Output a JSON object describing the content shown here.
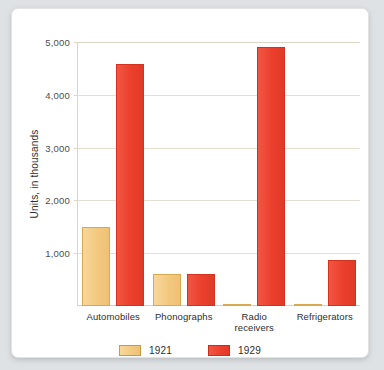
{
  "chart_data": {
    "type": "bar",
    "title": "",
    "subtitle": "",
    "xlabel": "",
    "ylabel": "Units, in thousands",
    "ylim": [
      0,
      5000
    ],
    "ytick_labels": [
      "5,000",
      "4,000",
      "3,000",
      "2,000",
      "1,000"
    ],
    "ytick_values": [
      5000,
      4000,
      3000,
      2000,
      1000
    ],
    "grid": true,
    "legend_position": "bottom",
    "categories": [
      "Automobiles",
      "Phonographs",
      "Radio\nreceivers",
      "Refrigerators"
    ],
    "series": [
      {
        "name": "1921",
        "color": "#F3C97F",
        "values": [
          1500,
          600,
          10,
          15
        ]
      },
      {
        "name": "1929",
        "color": "#EA3F2C",
        "values": [
          4580,
          610,
          4900,
          880
        ]
      }
    ],
    "colors": {
      "series_1921": "#F3C97F",
      "series_1921_border": "#D9A84F",
      "series_1929": "#EA3F2C",
      "series_1929_border": "#D3321F",
      "gridline": "#E6DED3",
      "card_background": "#FFFFFF",
      "page_background": "#DFE2E4",
      "text": "#2E2E2E"
    }
  },
  "legend": {
    "items": [
      {
        "label": "1921"
      },
      {
        "label": "1929"
      }
    ]
  }
}
